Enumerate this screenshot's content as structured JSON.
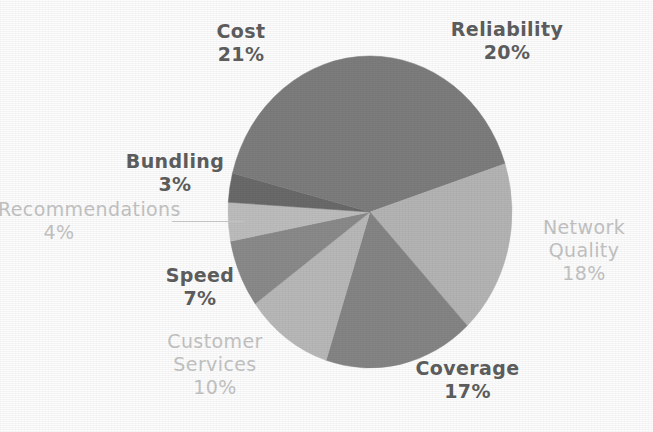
{
  "chart_data": {
    "type": "pie",
    "title": "",
    "subtitle": "",
    "xlabel": "",
    "ylabel": "",
    "legend_position": "none",
    "grid": false,
    "value_unit": "%",
    "start_angle_deg": 0,
    "direction": "clockwise",
    "categories": [
      "Reliability",
      "Network Quality",
      "Coverage",
      "Customer Services",
      "Speed",
      "Recommendations",
      "Bundling",
      "Cost"
    ],
    "values": [
      20,
      18,
      17,
      10,
      7,
      4,
      3,
      21
    ],
    "slices": [
      {
        "name": "Reliability",
        "label": "Reliability",
        "value": 20,
        "value_text": "20%",
        "color": "#7d7d7d",
        "label_style": "dark"
      },
      {
        "name": "Network Quality",
        "label": "Network\nQuality",
        "label_line1": "Network",
        "label_line2": "Quality",
        "value": 18,
        "value_text": "18%",
        "color": "#b4b4b4",
        "label_style": "light"
      },
      {
        "name": "Coverage",
        "label": "Coverage",
        "value": 17,
        "value_text": "17%",
        "color": "#858585",
        "label_style": "dark"
      },
      {
        "name": "Customer Services",
        "label": "Customer\nServices",
        "label_line1": "Customer",
        "label_line2": "Services",
        "value": 10,
        "value_text": "10%",
        "color": "#b8b8b8",
        "label_style": "light"
      },
      {
        "name": "Speed",
        "label": "Speed",
        "value": 7,
        "value_text": "7%",
        "color": "#8a8a8a",
        "label_style": "dark"
      },
      {
        "name": "Recommendations",
        "label": "Recommendations",
        "value": 4,
        "value_text": "4%",
        "color": "#bdbdbd",
        "label_style": "light",
        "has_leader_line": true
      },
      {
        "name": "Bundling",
        "label": "Bundling",
        "value": 3,
        "value_text": "3%",
        "color": "#6a6a6a",
        "label_style": "dark"
      },
      {
        "name": "Cost",
        "label": "Cost",
        "value": 21,
        "value_text": "21%",
        "color": "#7d7d7d",
        "label_style": "dark"
      }
    ],
    "total": 100,
    "geometry": {
      "center_x": 370,
      "center_y": 212,
      "radius_x": 142,
      "radius_y": 156
    }
  },
  "labels": {
    "cost": {
      "name": "Cost",
      "value": "21%"
    },
    "reliability": {
      "name": "Reliability",
      "value": "20%"
    },
    "network_l1": {
      "name": "Network",
      "value": ""
    },
    "network_l2": {
      "name": "Quality",
      "value": "18%"
    },
    "coverage": {
      "name": "Coverage",
      "value": "17%"
    },
    "customer_l1": {
      "name": "Customer",
      "value": ""
    },
    "customer_l2": {
      "name": "Services",
      "value": "10%"
    },
    "speed": {
      "name": "Speed",
      "value": "7%"
    },
    "bundling": {
      "name": "Bundling",
      "value": "3%"
    },
    "recommendations": {
      "name": "Recommendations",
      "value": "4%"
    }
  },
  "colors": {
    "background": "#fdfdfd",
    "label_dark": "#5e5e5e",
    "label_light": "#c3c3c3",
    "leader_line": "#c9c9c9"
  }
}
